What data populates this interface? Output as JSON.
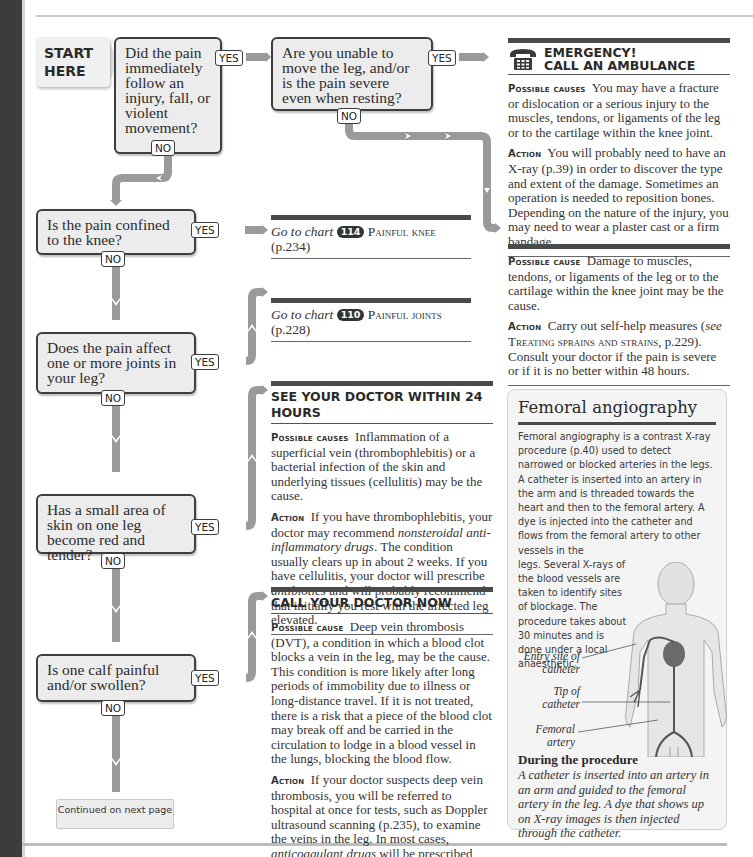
{
  "page": {
    "start_label": "START\nHERE",
    "continued_label": "Continued on next page"
  },
  "flowchart": {
    "yes_label": "YES",
    "no_label": "NO",
    "questions": [
      {
        "id": "q1",
        "text": "Did the pain immediately follow an injury, fall, or violent movement?"
      },
      {
        "id": "q2",
        "text": "Are you unable to move the leg, and/or is the pain severe even when resting?"
      },
      {
        "id": "q3",
        "text": "Is the pain confined to the knee?"
      },
      {
        "id": "q4",
        "text": "Does the pain affect one or more joints in your leg?"
      },
      {
        "id": "q5",
        "text": "Has a small area of skin on one leg become red and tender?"
      },
      {
        "id": "q6",
        "text": "Is one calf painful and/or swollen?"
      }
    ]
  },
  "outcomes": {
    "emergency": {
      "icon": "telephone-icon",
      "title_line1": "EMERGENCY!",
      "title_line2": "CALL AN AMBULANCE",
      "causes_label": "Possible causes",
      "causes_text": "You may have a fracture or dislocation or a serious injury to the muscles, tendons, or ligaments of the leg or to the cartilage within the knee joint.",
      "action_label": "Action",
      "action_text": "You will probably need to have an X-ray (p.39) in order to discover the type and extent of the damage. Sometimes an operation is needed to reposition bones. Depending on the nature of the injury, you may need to wear a plaster cast or a firm bandage."
    },
    "sprain": {
      "cause_label": "Possible cause",
      "cause_text": "Damage to muscles, tendons, or ligaments of the leg or to the cartilage within the knee joint may be the cause.",
      "action_label": "Action",
      "action_text_1": "Carry out self-help measures (",
      "action_see": "see",
      "action_ref": "Treating sprains and strains",
      "action_text_2": ", p.229). Consult your doctor if the pain is severe or if it is no better within 48 hours."
    },
    "knee": {
      "goto": "Go to chart",
      "chart_number": "114",
      "chart_title": "Painful knee",
      "page": "(p.234)"
    },
    "joints": {
      "goto": "Go to chart",
      "chart_number": "110",
      "chart_title": "Painful joints",
      "page": "(p.228)"
    },
    "doctor24": {
      "title": "SEE YOUR DOCTOR WITHIN 24 HOURS",
      "causes_label": "Possible causes",
      "causes_text": "Inflammation of a superficial vein (thrombophlebitis) or a bacterial infection of the skin and underlying tissues (cellulitis) may be the cause.",
      "action_label": "Action",
      "action_a": "If you have thrombophlebitis, your doctor may recommend ",
      "action_em1": "nonsteroidal anti-inflammatory drugs",
      "action_b": ". The condition usually clears up in about 2 weeks. If you have cellulitis, your doctor will prescribe ",
      "action_em2": "antibiotics",
      "action_c": " and will probably recommend that initially you rest with the affected leg elevated."
    },
    "doctor_now": {
      "title": "CALL YOUR DOCTOR NOW",
      "cause_label": "Possible cause",
      "cause_text": "Deep vein thrombosis (DVT), a condition in which a blood clot blocks a vein in the leg, may be the cause. This condition is more likely after long periods of immobility due to illness or long-distance travel. If it is not treated, there is a risk that a piece of the blood clot may break off and be carried in the circulation to lodge in a blood vessel in the lungs, blocking the blood flow.",
      "action_label": "Action",
      "action_a": "If your doctor suspects deep vein thrombosis, you will be referred to hospital at once for tests, such as Doppler ultrasound scanning (p.235), to examine the veins in the leg. In most cases, ",
      "action_em": "anticoagulant drugs",
      "action_b": " will be prescribed, initially by injection, and may be needed for several weeks."
    }
  },
  "femoral_box": {
    "title": "Femoral angiography",
    "body_wide": "Femoral angiography is a contrast X-ray procedure (p.40) used to detect narrowed or blocked arteries in the legs. A catheter is inserted into an artery in the arm and is threaded towards the heart and then to the femoral artery. A dye is injected into the catheter and flows from the femoral artery to other vessels in the",
    "body_narrow": "legs. Several X-rays of the blood vessels are taken to identify sites of blockage. The procedure takes about 30 minutes and is done under a local anaesthetic.",
    "figure_labels": {
      "entry": "Entry site of catheter",
      "tip": "Tip of catheter",
      "femoral": "Femoral artery"
    },
    "caption_title": "During the procedure",
    "caption_text": "A catheter is inserted into an artery in an arm and guided to the femoral artery in the leg. A dye that shows up on X-ray images is then injected through the catheter."
  },
  "colors": {
    "connector": "#9a9a9a",
    "question_fill": "#ececec",
    "dark_bar": "#4a4a4a",
    "spine": "#3c3c3c"
  }
}
